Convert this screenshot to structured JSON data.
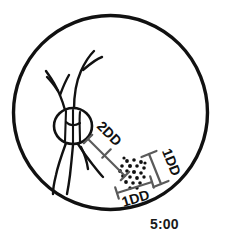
{
  "diagram": {
    "clock_position_label": "5:00",
    "labels": {
      "disc_to_lesion_distance": "2DD",
      "lesion_height": "1DD",
      "lesion_width": "1DD"
    },
    "colors": {
      "ink": "#111111",
      "measure_line": "#5a5a5a",
      "background": "#ffffff"
    },
    "fundus_circle": {
      "center_x": 110.5,
      "center_y": 112.5,
      "radius": 97,
      "stroke_width": 3.4
    },
    "optic_disc": {
      "center_x": 73,
      "center_y": 126,
      "radius_x": 19,
      "radius_y": 18,
      "stroke_width": 2.6
    },
    "lesion_cluster": {
      "center_x": 133,
      "center_y": 173,
      "dot_count": 22,
      "dot_radius": 1.9
    },
    "measure_2dd": {
      "from_x": 88,
      "from_y": 139,
      "to_x": 125,
      "to_y": 176,
      "tick_half": 6
    },
    "measure_1dd_vertical": {
      "from_x": 152,
      "from_y": 154,
      "to_x": 166,
      "to_y": 183,
      "tick_half": 6
    },
    "measure_1dd_horizontal": {
      "from_x": 119,
      "from_y": 190,
      "to_x": 155,
      "to_y": 178,
      "tick_half": 6
    }
  }
}
